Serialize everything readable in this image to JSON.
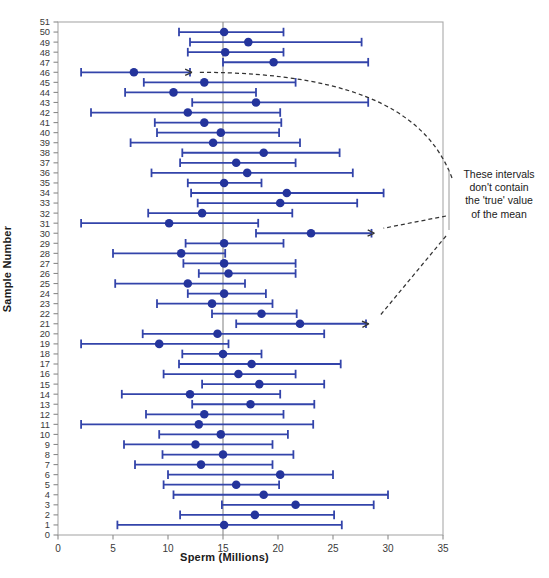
{
  "chart_data": {
    "type": "scatter",
    "title": "",
    "xlabel": "Sperm (Millions)",
    "ylabel": "Sample Number",
    "xlim": [
      0,
      35
    ],
    "ylim": [
      0,
      51
    ],
    "xticks": [
      0,
      5,
      10,
      15,
      20,
      25,
      30,
      35
    ],
    "yticks": [
      0,
      1,
      2,
      3,
      4,
      5,
      6,
      7,
      8,
      9,
      10,
      11,
      12,
      13,
      14,
      15,
      16,
      17,
      18,
      19,
      20,
      21,
      22,
      23,
      24,
      25,
      26,
      27,
      28,
      29,
      30,
      31,
      32,
      33,
      34,
      35,
      36,
      37,
      38,
      39,
      40,
      41,
      42,
      43,
      44,
      45,
      46,
      47,
      48,
      49,
      50,
      51
    ],
    "grid": false,
    "orientation": "horizontal",
    "reference_line": {
      "value": 15,
      "orientation": "vertical",
      "label": "true mean",
      "color": "#8a8a8a"
    },
    "series_name": "95% confidence interval of the mean",
    "marker_color": "#24349c",
    "interval_color": "#3344aa",
    "intervals": [
      {
        "sample": 50,
        "mean": 15.1,
        "low": 11.0,
        "high": 20.5,
        "contains_true": true
      },
      {
        "sample": 49,
        "mean": 17.3,
        "low": 12.0,
        "high": 27.6,
        "contains_true": true
      },
      {
        "sample": 48,
        "mean": 15.2,
        "low": 11.8,
        "high": 20.5,
        "contains_true": true
      },
      {
        "sample": 47,
        "mean": 19.6,
        "low": 15.0,
        "high": 28.2,
        "contains_true": true
      },
      {
        "sample": 46,
        "mean": 6.9,
        "low": 2.1,
        "high": 12.0,
        "contains_true": false
      },
      {
        "sample": 45,
        "mean": 13.3,
        "low": 7.8,
        "high": 21.6,
        "contains_true": true
      },
      {
        "sample": 44,
        "mean": 10.5,
        "low": 6.1,
        "high": 18.0,
        "contains_true": true
      },
      {
        "sample": 43,
        "mean": 18.0,
        "low": 12.2,
        "high": 28.2,
        "contains_true": true
      },
      {
        "sample": 42,
        "mean": 11.8,
        "low": 3.0,
        "high": 20.2,
        "contains_true": true
      },
      {
        "sample": 41,
        "mean": 13.3,
        "low": 8.8,
        "high": 20.3,
        "contains_true": true
      },
      {
        "sample": 40,
        "mean": 14.8,
        "low": 9.0,
        "high": 20.1,
        "contains_true": true
      },
      {
        "sample": 39,
        "mean": 14.1,
        "low": 6.6,
        "high": 22.0,
        "contains_true": true
      },
      {
        "sample": 38,
        "mean": 18.7,
        "low": 11.3,
        "high": 25.6,
        "contains_true": true
      },
      {
        "sample": 37,
        "mean": 16.2,
        "low": 11.1,
        "high": 21.6,
        "contains_true": true
      },
      {
        "sample": 36,
        "mean": 17.2,
        "low": 8.5,
        "high": 26.8,
        "contains_true": true
      },
      {
        "sample": 35,
        "mean": 15.1,
        "low": 11.8,
        "high": 18.5,
        "contains_true": true
      },
      {
        "sample": 34,
        "mean": 20.8,
        "low": 12.1,
        "high": 29.6,
        "contains_true": true
      },
      {
        "sample": 33,
        "mean": 20.2,
        "low": 12.7,
        "high": 27.2,
        "contains_true": true
      },
      {
        "sample": 32,
        "mean": 13.1,
        "low": 8.2,
        "high": 21.3,
        "contains_true": true
      },
      {
        "sample": 31,
        "mean": 10.1,
        "low": 2.1,
        "high": 18.2,
        "contains_true": true
      },
      {
        "sample": 30,
        "mean": 23.0,
        "low": 18.0,
        "high": 28.5,
        "contains_true": false
      },
      {
        "sample": 29,
        "mean": 15.1,
        "low": 11.6,
        "high": 20.5,
        "contains_true": true
      },
      {
        "sample": 28,
        "mean": 11.2,
        "low": 5.0,
        "high": 15.2,
        "contains_true": true
      },
      {
        "sample": 27,
        "mean": 15.1,
        "low": 11.4,
        "high": 21.6,
        "contains_true": true
      },
      {
        "sample": 26,
        "mean": 15.5,
        "low": 12.8,
        "high": 21.6,
        "contains_true": true
      },
      {
        "sample": 25,
        "mean": 11.8,
        "low": 5.2,
        "high": 17.0,
        "contains_true": true
      },
      {
        "sample": 24,
        "mean": 15.1,
        "low": 11.8,
        "high": 18.9,
        "contains_true": true
      },
      {
        "sample": 23,
        "mean": 14.0,
        "low": 9.0,
        "high": 19.5,
        "contains_true": true
      },
      {
        "sample": 22,
        "mean": 18.5,
        "low": 14.0,
        "high": 21.7,
        "contains_true": true
      },
      {
        "sample": 21,
        "mean": 22.0,
        "low": 16.2,
        "high": 28.0,
        "contains_true": false
      },
      {
        "sample": 20,
        "mean": 14.5,
        "low": 7.7,
        "high": 24.2,
        "contains_true": true
      },
      {
        "sample": 19,
        "mean": 9.2,
        "low": 2.1,
        "high": 15.5,
        "contains_true": true
      },
      {
        "sample": 18,
        "mean": 15.0,
        "low": 11.3,
        "high": 18.5,
        "contains_true": true
      },
      {
        "sample": 17,
        "mean": 17.6,
        "low": 11.0,
        "high": 25.7,
        "contains_true": true
      },
      {
        "sample": 16,
        "mean": 16.4,
        "low": 9.6,
        "high": 21.6,
        "contains_true": true
      },
      {
        "sample": 15,
        "mean": 18.3,
        "low": 13.1,
        "high": 24.2,
        "contains_true": true
      },
      {
        "sample": 14,
        "mean": 12.0,
        "low": 5.8,
        "high": 20.2,
        "contains_true": true
      },
      {
        "sample": 13,
        "mean": 17.5,
        "low": 12.2,
        "high": 23.3,
        "contains_true": true
      },
      {
        "sample": 12,
        "mean": 13.3,
        "low": 8.0,
        "high": 20.5,
        "contains_true": true
      },
      {
        "sample": 11,
        "mean": 12.8,
        "low": 2.1,
        "high": 23.2,
        "contains_true": true
      },
      {
        "sample": 10,
        "mean": 14.8,
        "low": 9.2,
        "high": 20.9,
        "contains_true": true
      },
      {
        "sample": 9,
        "mean": 12.5,
        "low": 6.0,
        "high": 19.5,
        "contains_true": true
      },
      {
        "sample": 8,
        "mean": 15.0,
        "low": 9.5,
        "high": 21.4,
        "contains_true": true
      },
      {
        "sample": 7,
        "mean": 13.0,
        "low": 7.0,
        "high": 19.5,
        "contains_true": true
      },
      {
        "sample": 6,
        "mean": 20.2,
        "low": 10.0,
        "high": 25.0,
        "contains_true": true
      },
      {
        "sample": 5,
        "mean": 16.2,
        "low": 9.6,
        "high": 20.1,
        "contains_true": true
      },
      {
        "sample": 4,
        "mean": 18.7,
        "low": 10.5,
        "high": 30.0,
        "contains_true": true
      },
      {
        "sample": 3,
        "mean": 21.6,
        "low": 14.9,
        "high": 28.7,
        "contains_true": true
      },
      {
        "sample": 2,
        "mean": 17.9,
        "low": 11.1,
        "high": 25.1,
        "contains_true": true
      },
      {
        "sample": 1,
        "mean": 15.1,
        "low": 5.4,
        "high": 25.8,
        "contains_true": true
      }
    ],
    "annotations": [
      {
        "lines": [
          "These intervals",
          "don't contain",
          "the 'true' value",
          "of the mean"
        ],
        "points_to_samples": [
          46,
          30,
          21
        ]
      }
    ]
  },
  "axes": {
    "xlabel": "Sperm (Millions)",
    "ylabel": "Sample Number"
  },
  "annotation_text": {
    "line1": "These intervals",
    "line2": "don't contain",
    "line3": "the 'true' value",
    "line4": "of the mean"
  }
}
